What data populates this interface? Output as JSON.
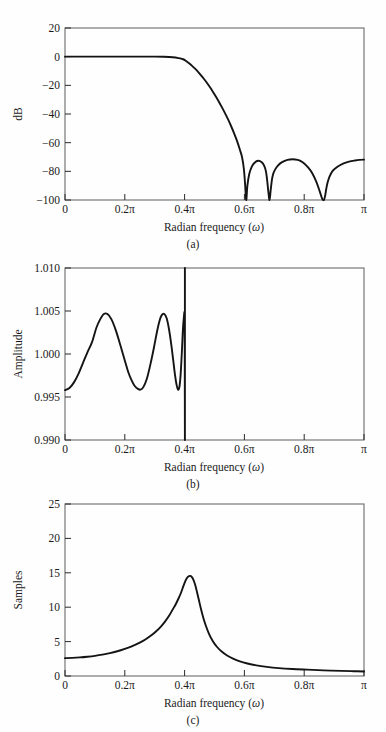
{
  "figure": {
    "caption_a": "(a)",
    "caption_b": "(b)",
    "caption_c": "(c)",
    "xaxis_title": "Radian frequency (ω)",
    "xaxis_title_main": "Radian frequency (",
    "xaxis_title_sym": "ω",
    "xaxis_title_tail": ")",
    "line_color": "#141414",
    "frame_color": "#6b6b6b",
    "background": "#fefefe"
  },
  "chart_data": [
    {
      "type": "line",
      "title": "(a)",
      "xlabel": "Radian frequency (ω)",
      "ylabel": "dB",
      "xlim": [
        0,
        1
      ],
      "ylim": [
        -100,
        20
      ],
      "grid": false,
      "legend": "none",
      "xtick_values": [
        0,
        0.2,
        0.4,
        0.6,
        0.8,
        1.0
      ],
      "xtick_labels": [
        "0",
        "0.2π",
        "0.4π",
        "0.6π",
        "0.8π",
        "π"
      ],
      "ytick_values": [
        20,
        0,
        -20,
        -40,
        -60,
        -80,
        -100
      ],
      "ytick_labels": [
        "20",
        "0",
        "−20",
        "−40",
        "−60",
        "−80",
        "−100"
      ],
      "series": [
        {
          "name": "magnitude response (dB)",
          "x": [
            0.0,
            0.05,
            0.1,
            0.15,
            0.2,
            0.25,
            0.3,
            0.33,
            0.36,
            0.38,
            0.395,
            0.405,
            0.415,
            0.425,
            0.435,
            0.445,
            0.455,
            0.465,
            0.475,
            0.485,
            0.495,
            0.505,
            0.515,
            0.525,
            0.535,
            0.545,
            0.555,
            0.565,
            0.575,
            0.585,
            0.592,
            0.598,
            0.602,
            0.606,
            0.61,
            0.616,
            0.624,
            0.634,
            0.646,
            0.658,
            0.666,
            0.672,
            0.676,
            0.68,
            0.684,
            0.688,
            0.692,
            0.696,
            0.702,
            0.712,
            0.726,
            0.744,
            0.762,
            0.778,
            0.79,
            0.8,
            0.812,
            0.826,
            0.84,
            0.852,
            0.86,
            0.866,
            0.87,
            0.874,
            0.878,
            0.884,
            0.894,
            0.91,
            0.93,
            0.95,
            0.97,
            0.985,
            1.0
          ],
          "values": [
            0.0,
            0.0,
            0.0,
            0.0,
            0.0,
            0.0,
            0.0,
            -0.1,
            -0.4,
            -1.0,
            -1.8,
            -3.0,
            -4.6,
            -6.4,
            -8.4,
            -10.6,
            -13.0,
            -15.6,
            -18.4,
            -21.4,
            -24.6,
            -28.0,
            -31.6,
            -35.4,
            -39.4,
            -43.6,
            -48.2,
            -53.2,
            -58.6,
            -65.0,
            -70.0,
            -78.0,
            -88.0,
            -100.0,
            -90.0,
            -82.0,
            -77.0,
            -74.0,
            -72.6,
            -73.6,
            -76.0,
            -80.0,
            -86.0,
            -94.0,
            -100.0,
            -93.0,
            -86.0,
            -82.0,
            -79.0,
            -76.0,
            -73.6,
            -72.0,
            -71.6,
            -72.0,
            -73.0,
            -74.5,
            -77.0,
            -81.0,
            -87.0,
            -94.0,
            -99.0,
            -100.0,
            -97.0,
            -92.0,
            -88.0,
            -84.0,
            -80.0,
            -77.0,
            -74.6,
            -73.2,
            -72.4,
            -72.0,
            -71.8
          ]
        }
      ],
      "top_gradient_line": {
        "y": 20,
        "note": "thin colored rule along top frame"
      }
    },
    {
      "type": "line",
      "title": "(b)",
      "xlabel": "Radian frequency (ω)",
      "ylabel": "Amplitude",
      "xlim": [
        0,
        1
      ],
      "ylim": [
        0.99,
        1.01
      ],
      "grid": false,
      "legend": "none",
      "xtick_values": [
        0,
        0.2,
        0.4,
        0.6,
        0.8,
        1.0
      ],
      "xtick_labels": [
        "0",
        "0.2π",
        "0.4π",
        "0.6π",
        "0.8π",
        "π"
      ],
      "ytick_values": [
        1.01,
        1.005,
        1.0,
        0.995,
        0.99
      ],
      "ytick_labels": [
        "1.010",
        "1.005",
        "1.000",
        "0.995",
        "0.990"
      ],
      "series": [
        {
          "name": "passband amplitude ripple",
          "x": [
            0.0,
            0.015,
            0.03,
            0.045,
            0.06,
            0.075,
            0.09,
            0.105,
            0.118,
            0.13,
            0.142,
            0.155,
            0.17,
            0.185,
            0.2,
            0.212,
            0.224,
            0.234,
            0.244,
            0.252,
            0.262,
            0.274,
            0.286,
            0.298,
            0.308,
            0.316,
            0.324,
            0.332,
            0.34,
            0.348,
            0.356,
            0.362,
            0.368,
            0.373,
            0.378,
            0.383,
            0.387,
            0.391,
            0.394,
            0.397,
            0.4,
            0.4005,
            0.401
          ],
          "values": [
            0.9958,
            0.99605,
            0.9967,
            0.9977,
            0.99895,
            1.0002,
            1.00135,
            1.00305,
            1.00405,
            1.00465,
            1.00465,
            1.00405,
            1.00275,
            1.00105,
            0.99925,
            0.99785,
            0.99685,
            0.99625,
            0.99595,
            0.99585,
            0.99615,
            0.99715,
            0.99885,
            1.00085,
            1.00265,
            1.00385,
            1.00455,
            1.00465,
            1.00415,
            1.00285,
            1.00095,
            0.99925,
            0.99755,
            0.99645,
            0.99585,
            0.99625,
            0.99775,
            1.00035,
            1.00265,
            1.00405,
            1.00465,
            1.0,
            0.99
          ]
        }
      ],
      "stopband_note": "amplitude drops vertically to below 0.990 at 0.4π"
    },
    {
      "type": "line",
      "title": "(c)",
      "xlabel": "Radian frequency (ω)",
      "ylabel": "Samples",
      "xlim": [
        0,
        1
      ],
      "ylim": [
        0,
        25
      ],
      "grid": false,
      "legend": "none",
      "xtick_values": [
        0,
        0.2,
        0.4,
        0.6,
        0.8,
        1.0
      ],
      "xtick_labels": [
        "0",
        "0.2π",
        "0.4π",
        "0.6π",
        "0.8π",
        "π"
      ],
      "ytick_values": [
        0,
        5,
        10,
        15,
        20,
        25
      ],
      "ytick_labels": [
        "0",
        "5",
        "10",
        "15",
        "20",
        "25"
      ],
      "series": [
        {
          "name": "group delay (samples)",
          "x": [
            0.0,
            0.025,
            0.05,
            0.075,
            0.1,
            0.125,
            0.15,
            0.175,
            0.2,
            0.225,
            0.25,
            0.27,
            0.29,
            0.305,
            0.32,
            0.335,
            0.348,
            0.36,
            0.37,
            0.38,
            0.388,
            0.395,
            0.401,
            0.406,
            0.411,
            0.415,
            0.419,
            0.423,
            0.427,
            0.432,
            0.437,
            0.442,
            0.448,
            0.455,
            0.463,
            0.472,
            0.482,
            0.494,
            0.508,
            0.524,
            0.542,
            0.562,
            0.585,
            0.61,
            0.64,
            0.675,
            0.715,
            0.76,
            0.81,
            0.865,
            0.925,
            0.965,
            1.0
          ],
          "values": [
            2.6,
            2.63,
            2.7,
            2.8,
            2.93,
            3.1,
            3.32,
            3.6,
            3.95,
            4.35,
            4.85,
            5.35,
            5.95,
            6.5,
            7.15,
            7.95,
            8.75,
            9.65,
            10.4,
            11.3,
            12.1,
            12.95,
            13.65,
            14.1,
            14.4,
            14.52,
            14.55,
            14.45,
            14.2,
            13.7,
            13.0,
            12.1,
            11.0,
            9.7,
            8.4,
            7.2,
            6.1,
            5.1,
            4.25,
            3.55,
            2.98,
            2.52,
            2.12,
            1.82,
            1.55,
            1.33,
            1.15,
            1.02,
            0.92,
            0.82,
            0.74,
            0.7,
            0.66
          ]
        }
      ]
    }
  ]
}
